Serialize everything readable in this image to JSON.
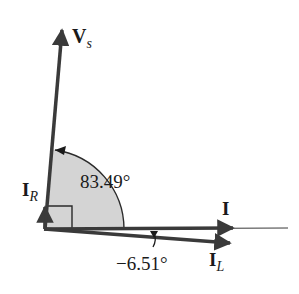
{
  "diagram": {
    "type": "phasor-diagram",
    "colors": {
      "line": "#3a3a3a",
      "arc_fill": "#d4d4d4",
      "text": "#1a1a1a",
      "background": "#ffffff"
    },
    "phasors": [
      {
        "name": "Vs",
        "label_main": "V",
        "label_sub": "s",
        "angle_deg": 83.49
      },
      {
        "name": "IR",
        "label_main": "I",
        "label_sub": "R",
        "angle_deg": 90
      },
      {
        "name": "I",
        "label_main": "I",
        "label_sub": "",
        "angle_deg": 0
      },
      {
        "name": "IL",
        "label_main": "I",
        "label_sub": "L",
        "angle_deg": -6.51
      }
    ],
    "angle_labels": {
      "vs_angle": "83.49°",
      "il_angle": "−6.51°"
    }
  }
}
